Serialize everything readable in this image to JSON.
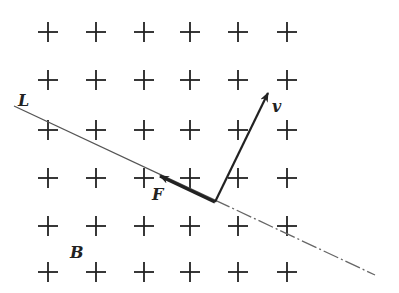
{
  "diagram": {
    "field": {
      "label": "B",
      "direction": "out-of-page-plus-markers",
      "grid": {
        "columns_x": [
          48,
          96,
          144,
          190,
          238,
          287
        ],
        "rows_y": [
          32,
          80,
          130,
          178,
          226,
          272
        ],
        "marker": "+",
        "half_size": 10
      },
      "label_pos": [
        70,
        258
      ]
    },
    "line": {
      "label": "L",
      "start": [
        14,
        106
      ],
      "end": [
        375,
        275
      ],
      "solid_until_x": 215,
      "label_pos": [
        18,
        106
      ]
    },
    "vectors": [
      {
        "name": "velocity",
        "label": "v",
        "from": [
          215,
          202
        ],
        "to": [
          268,
          93
        ],
        "label_pos": [
          272,
          112
        ]
      },
      {
        "name": "force",
        "label": "F",
        "from": [
          215,
          202
        ],
        "to": [
          160,
          176
        ],
        "label_pos": [
          152,
          200
        ]
      }
    ],
    "colors": {
      "ink": "#222222",
      "line": "#555555",
      "background": "#ffffff"
    }
  }
}
